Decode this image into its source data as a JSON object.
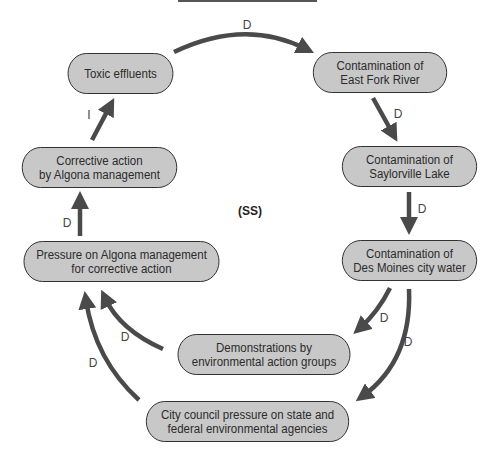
{
  "diagram": {
    "center_label": "(SS)",
    "nodes": [
      {
        "id": "toxic",
        "label": "Toxic effluents"
      },
      {
        "id": "eastfork",
        "label": "Contamination of\nEast Fork River"
      },
      {
        "id": "saylorville",
        "label": "Contamination of\nSaylorville Lake"
      },
      {
        "id": "desmoines",
        "label": "Contamination of\nDes Moines city water"
      },
      {
        "id": "demonstrations",
        "label": "Demonstrations by\nenvironmental action groups"
      },
      {
        "id": "citycouncil",
        "label": "City council pressure on state and\nfederal environmental agencies"
      },
      {
        "id": "pressure",
        "label": "Pressure on Algona management\nfor corrective action"
      },
      {
        "id": "corrective",
        "label": "Corrective action\nby Algona management"
      }
    ],
    "edges": [
      {
        "from": "toxic",
        "to": "eastfork",
        "label": "D"
      },
      {
        "from": "eastfork",
        "to": "saylorville",
        "label": "D"
      },
      {
        "from": "saylorville",
        "to": "desmoines",
        "label": "D"
      },
      {
        "from": "desmoines",
        "to": "demonstrations",
        "label": "D"
      },
      {
        "from": "desmoines",
        "to": "citycouncil",
        "label": "D"
      },
      {
        "from": "demonstrations",
        "to": "pressure",
        "label": "D"
      },
      {
        "from": "citycouncil",
        "to": "pressure",
        "label": "D"
      },
      {
        "from": "pressure",
        "to": "corrective",
        "label": "D"
      },
      {
        "from": "corrective",
        "to": "toxic",
        "label": "I"
      }
    ],
    "colors": {
      "node_fill": "#c8c8c8",
      "arrow": "#4a4a4a",
      "border": "#2a2a2a"
    }
  }
}
